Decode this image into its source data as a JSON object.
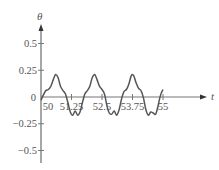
{
  "chart_data": {
    "type": "line",
    "title": "",
    "xlabel": "t",
    "ylabel": "θ",
    "xlim": [
      50,
      55.5
    ],
    "ylim": [
      -0.6,
      0.6
    ],
    "grid": false,
    "legend": null,
    "x_ticks": [
      {
        "value": 50,
        "label": "50"
      },
      {
        "value": 51.25,
        "label": "51.25"
      },
      {
        "value": 52.5,
        "label": "52.5"
      },
      {
        "value": 53.75,
        "label": "53.75"
      },
      {
        "value": 55,
        "label": "55"
      }
    ],
    "y_ticks": [
      {
        "value": 0.5,
        "label": "0.5"
      },
      {
        "value": 0.25,
        "label": "0.25"
      },
      {
        "value": 0,
        "label": "0"
      },
      {
        "value": -0.25,
        "label": "−0.25"
      },
      {
        "value": -0.5,
        "label": "−0.5"
      }
    ],
    "series": [
      {
        "name": "θ(t)",
        "color": "#555555",
        "x": [
          50.0,
          50.1,
          50.2,
          50.3,
          50.4,
          50.5,
          50.6,
          50.7,
          50.8,
          50.9,
          51.0,
          51.1,
          51.2,
          51.3,
          51.4,
          51.5,
          51.6,
          51.7,
          51.8,
          51.9,
          52.0,
          52.1,
          52.2,
          52.3,
          52.4,
          52.5,
          52.6,
          52.7,
          52.8,
          52.9,
          53.0,
          53.1,
          53.2,
          53.3,
          53.4,
          53.5,
          53.6,
          53.7,
          53.8,
          53.9,
          54.0,
          54.1,
          54.2,
          54.3,
          54.4,
          54.5,
          54.6,
          54.7,
          54.8,
          54.9,
          55.0
        ],
        "values": [
          -0.03,
          0.02,
          0.06,
          0.07,
          0.1,
          0.16,
          0.21,
          0.18,
          0.1,
          0.06,
          0.03,
          -0.05,
          -0.14,
          -0.17,
          -0.13,
          -0.17,
          -0.14,
          -0.05,
          0.03,
          0.06,
          0.1,
          0.18,
          0.21,
          0.16,
          0.1,
          0.07,
          0.03,
          -0.08,
          -0.15,
          -0.16,
          -0.13,
          -0.17,
          -0.12,
          -0.02,
          0.05,
          0.07,
          0.12,
          0.2,
          0.2,
          0.13,
          0.08,
          0.06,
          -0.01,
          -0.12,
          -0.17,
          -0.14,
          -0.15,
          -0.16,
          -0.08,
          0.02,
          0.07
        ]
      }
    ]
  }
}
